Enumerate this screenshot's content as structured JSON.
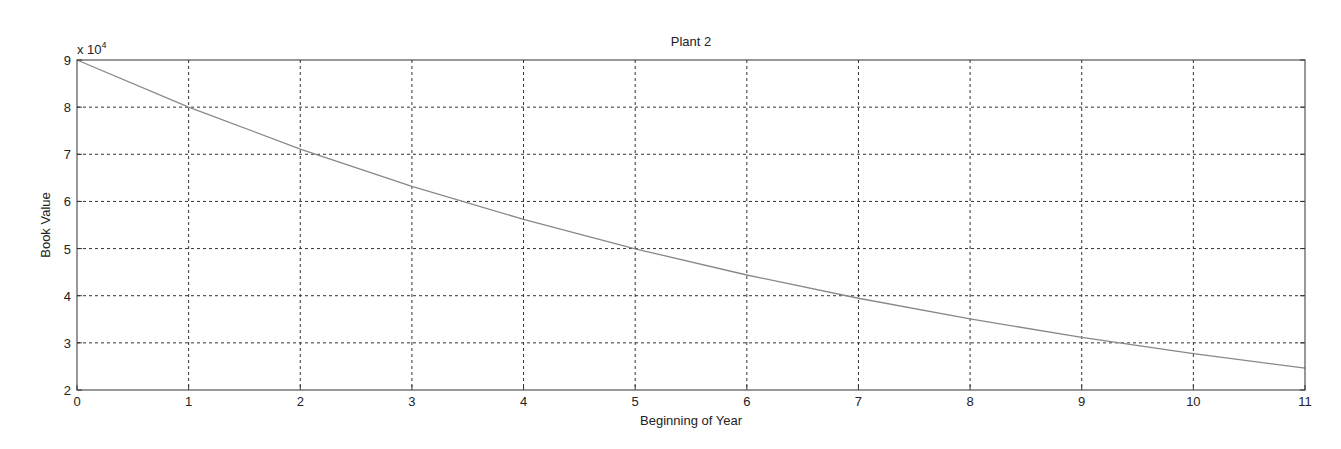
{
  "chart_data": {
    "type": "line",
    "title": "Plant 2",
    "xlabel": "Beginning of Year",
    "ylabel": "Book Value",
    "y_exponent_label": "x 10",
    "y_exponent": "4",
    "xlim": [
      0,
      11
    ],
    "ylim": [
      20000,
      90000
    ],
    "grid": true,
    "x_ticks": [
      0,
      1,
      2,
      3,
      4,
      5,
      6,
      7,
      8,
      9,
      10,
      11
    ],
    "y_ticks": [
      2,
      3,
      4,
      5,
      6,
      7,
      8,
      9
    ],
    "x": [
      0,
      1,
      2,
      3,
      4,
      5,
      6,
      7,
      8,
      9,
      10,
      11
    ],
    "series": [
      {
        "name": "Plant 2",
        "color": "#888888",
        "values": [
          90000,
          80000,
          71111,
          63210,
          56187,
          49944,
          44395,
          39462,
          35077,
          31180,
          27715,
          24636
        ]
      }
    ]
  }
}
